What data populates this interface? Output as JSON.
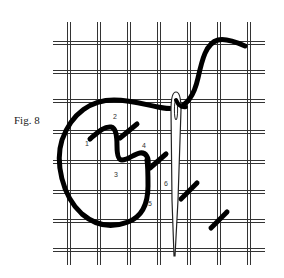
{
  "figure": {
    "caption": "Fig. 8",
    "colors": {
      "background": "#ffffff",
      "grid": "#333333",
      "thread": "#000000",
      "needle": "#222222",
      "label": "#333333"
    },
    "grid": {
      "vertical_x": [
        69,
        99,
        129,
        159,
        189,
        219,
        249
      ],
      "horizontal_y": [
        43,
        72,
        101,
        132,
        162,
        192,
        221,
        250
      ],
      "x_extent": [
        53,
        265
      ],
      "y_extent": [
        22,
        265
      ]
    },
    "step_labels": [
      {
        "text": "1",
        "x": 85,
        "y": 140
      },
      {
        "text": "2",
        "x": 113,
        "y": 113
      },
      {
        "text": "3",
        "x": 114,
        "y": 171
      },
      {
        "text": "4",
        "x": 142,
        "y": 142
      },
      {
        "text": "5",
        "x": 148,
        "y": 200
      },
      {
        "text": "6",
        "x": 164,
        "y": 180
      }
    ],
    "stitches": [
      {
        "from": [
          181,
          199
        ],
        "to": [
          197,
          183
        ]
      },
      {
        "from": [
          211,
          228
        ],
        "to": [
          227,
          212
        ]
      }
    ]
  }
}
